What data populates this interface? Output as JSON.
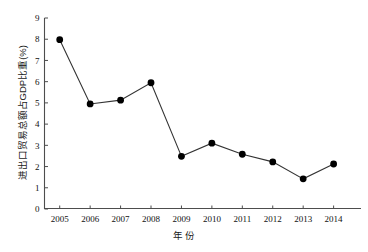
{
  "chart_data": {
    "type": "line",
    "title": "",
    "subtitle": "",
    "xlabel": "年  份",
    "ylabel": "进出口贸易总额占GDP比重(%)",
    "categories": [
      "2005",
      "2006",
      "2007",
      "2008",
      "2009",
      "2010",
      "2011",
      "2012",
      "2013",
      "2014"
    ],
    "x": [
      2005,
      2006,
      2007,
      2008,
      2009,
      2010,
      2011,
      2012,
      2013,
      2014
    ],
    "values": [
      7.98,
      4.95,
      5.13,
      5.95,
      2.48,
      3.1,
      2.58,
      2.22,
      1.42,
      2.12
    ],
    "series": [
      {
        "name": "进出口贸易总额占GDP比重",
        "values": [
          7.98,
          4.95,
          5.13,
          5.95,
          2.48,
          3.1,
          2.58,
          2.22,
          1.42,
          2.12
        ]
      }
    ],
    "ylim": [
      0,
      9
    ],
    "xlim": [
      2004.5,
      2014.9
    ],
    "yticks": [
      0,
      1,
      2,
      3,
      4,
      5,
      6,
      7,
      8,
      9
    ],
    "ytick_labels": [
      "0",
      "1",
      "2",
      "3",
      "4",
      "5",
      "6",
      "7",
      "8",
      "9"
    ],
    "xticks": [
      2005,
      2006,
      2007,
      2008,
      2009,
      2010,
      2011,
      2012,
      2013,
      2014
    ],
    "xtick_labels": [
      "2005",
      "2006",
      "2007",
      "2008",
      "2009",
      "2010",
      "2011",
      "2012",
      "2013",
      "2014"
    ],
    "grid": false,
    "legend": false,
    "legend_position": "none",
    "marker": "filled-circle",
    "marker_color": "#000000",
    "line_color": "#333333",
    "annotations": []
  },
  "axes": {
    "y_axis_label": "进出口贸易总额占GDP比重(%)",
    "x_axis_label_part1": "年",
    "x_axis_label_part2": "份"
  }
}
